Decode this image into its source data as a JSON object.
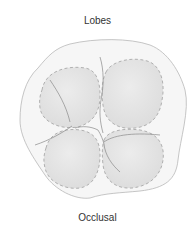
{
  "diagram": {
    "title": "Lobes",
    "caption": "Occlusal",
    "colors": {
      "crown_fill": "#f6f6f6",
      "crown_outline": "#b8b8b8",
      "lobe_fill": "#e4e4e4",
      "lobe_dash": "#b0b0b0",
      "groove": "#8a8a8a",
      "text": "#333333"
    }
  }
}
